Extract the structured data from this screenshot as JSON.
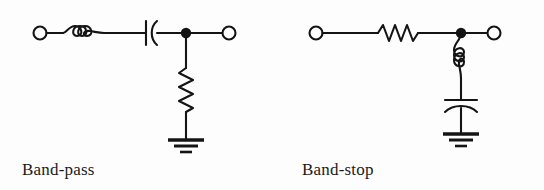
{
  "figure": {
    "background_color": "#fdfdfd",
    "ink_color": "#141414",
    "width": 544,
    "height": 190
  },
  "circuits": [
    {
      "id": "band-pass",
      "caption": "Band-pass",
      "topology": "series LC into shunt R (T-section)",
      "series_branch": [
        {
          "symbol": "inductor",
          "orientation": "horizontal",
          "loops": 3
        },
        {
          "symbol": "capacitor",
          "orientation": "horizontal",
          "style": "plate-and-curve"
        }
      ],
      "shunt_branch": [
        {
          "symbol": "resistor",
          "orientation": "vertical",
          "zigzags": 6
        },
        {
          "symbol": "ground",
          "bars": 3
        }
      ],
      "terminals": [
        {
          "name": "input-terminal",
          "style": "open-circle"
        },
        {
          "name": "output-terminal",
          "style": "open-circle"
        }
      ],
      "junction": {
        "name": "junction-dot",
        "style": "filled-circle"
      }
    },
    {
      "id": "band-stop",
      "caption": "Band-stop",
      "topology": "series R into shunt LC (T-section)",
      "series_branch": [
        {
          "symbol": "resistor",
          "orientation": "horizontal",
          "zigzags": 6
        }
      ],
      "shunt_branch": [
        {
          "symbol": "inductor",
          "orientation": "vertical",
          "loops": 3
        },
        {
          "symbol": "capacitor",
          "orientation": "vertical",
          "style": "plate-and-curve"
        },
        {
          "symbol": "ground",
          "bars": 3
        }
      ],
      "terminals": [
        {
          "name": "input-terminal",
          "style": "open-circle"
        },
        {
          "name": "output-terminal",
          "style": "open-circle"
        }
      ],
      "junction": {
        "name": "junction-dot",
        "style": "filled-circle"
      }
    }
  ]
}
